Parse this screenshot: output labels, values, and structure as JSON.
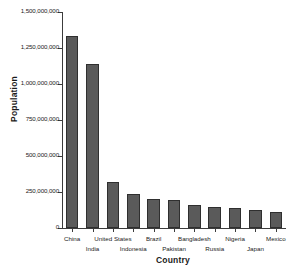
{
  "chart_data": {
    "type": "bar",
    "title": "",
    "xlabel": "Country",
    "ylabel": "Population",
    "categories": [
      "China",
      "India",
      "United States",
      "Indonesia",
      "Brazil",
      "Pakistan",
      "Bangladesh",
      "Russia",
      "Nigeria",
      "Japan",
      "Mexico"
    ],
    "values": [
      1330000000,
      1140000000,
      318000000,
      237000000,
      204000000,
      193000000,
      160000000,
      146000000,
      140000000,
      127000000,
      112000000
    ],
    "ylim": [
      0,
      1500000000
    ],
    "ytick_values": [
      0,
      250000000,
      500000000,
      750000000,
      1000000000,
      1250000000,
      1500000000
    ],
    "ytick_labels": [
      "0",
      "250,000,000",
      "500,000,000",
      "750,000,000",
      "1,000,000,000",
      "1,250,000,000",
      "1,500,000,000"
    ],
    "grid": false,
    "legend": false,
    "bar_color": "#5a5a5a",
    "bar_edge_color": "#2f2f2f",
    "axis_color": "#3c3c3c",
    "label_stagger": [
      0,
      1,
      0,
      1,
      0,
      1,
      0,
      1,
      0,
      1,
      0
    ]
  }
}
